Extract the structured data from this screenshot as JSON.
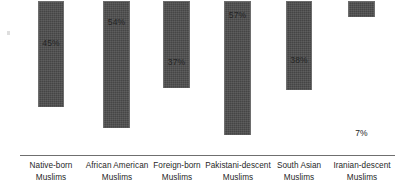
{
  "chart_data": {
    "type": "bar",
    "title": "",
    "subtitle": "",
    "xlabel": "",
    "ylabel": "",
    "ylim": [
      0,
      60
    ],
    "grid": false,
    "legend": false,
    "orientation": "vertical",
    "value_suffix": "%",
    "categories": [
      "Native-born Muslims",
      "African American Muslims",
      "Foreign-born Muslims",
      "Pakistani-descent Muslims",
      "South Asian Muslims",
      "Iranian-descent Muslims"
    ],
    "values": [
      45,
      54,
      37,
      57,
      38,
      7
    ],
    "bars": [
      {
        "label_line1": "Native-born",
        "label_line2": "Muslims",
        "value": 45,
        "value_label": "45%",
        "left": 38,
        "width": 26,
        "label_left": 19,
        "label_width": 64
      },
      {
        "label_line1": "African American",
        "label_line2": "Muslims",
        "value": 54,
        "value_label": "54%",
        "left": 103,
        "width": 27,
        "label_left": 82,
        "label_width": 70
      },
      {
        "label_line1": "Foreign-born",
        "label_line2": "Muslims",
        "value": 37,
        "value_label": "37%",
        "left": 163,
        "width": 27,
        "label_left": 146,
        "label_width": 62
      },
      {
        "label_line1": "Pakistani-descent",
        "label_line2": "Muslims",
        "value": 57,
        "value_label": "57%",
        "left": 224,
        "width": 27,
        "label_left": 201,
        "label_width": 74
      },
      {
        "label_line1": "South Asian",
        "label_line2": "Muslims",
        "value": 38,
        "value_label": "38%",
        "left": 286,
        "width": 26,
        "label_left": 269,
        "label_width": 60
      },
      {
        "label_line1": "Iranian-descent",
        "label_line2": "Muslims",
        "value": 7,
        "value_label": "7%",
        "left": 348,
        "width": 27,
        "label_left": 329,
        "label_width": 66
      }
    ]
  },
  "style": {
    "bar_color": "#4c4c4c",
    "bar_border_color": "#6d6d6d",
    "axis_color": "#6f6f6f",
    "text_color": "#1f1f1f",
    "background": "#ffffff"
  }
}
